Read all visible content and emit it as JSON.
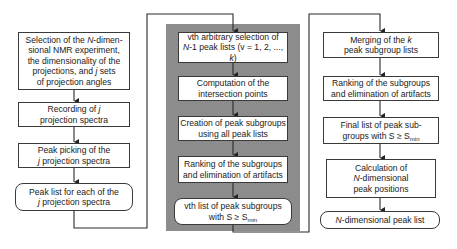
{
  "diagram": {
    "left_column": [
      {
        "id": "L1",
        "shape": "rect",
        "parts": [
          {
            "t": "Selection of the "
          },
          {
            "t": "N",
            "i": true
          },
          {
            "t": "-dimen-\nsional NMR experiment,\nthe dimensionality of the\nprojections, and "
          },
          {
            "t": "j",
            "i": true
          },
          {
            "t": " sets\nof projection angles"
          }
        ]
      },
      {
        "id": "L2",
        "shape": "rect",
        "parts": [
          {
            "t": "Recording of "
          },
          {
            "t": "j",
            "i": true
          },
          {
            "t": "\nprojection spectra"
          }
        ]
      },
      {
        "id": "L3",
        "shape": "rect",
        "parts": [
          {
            "t": "Peak picking of the\n"
          },
          {
            "t": "j",
            "i": true
          },
          {
            "t": " projection spectra"
          }
        ]
      },
      {
        "id": "L4",
        "shape": "rounded",
        "parts": [
          {
            "t": "Peak list for each of the\n"
          },
          {
            "t": "j",
            "i": true
          },
          {
            "t": " projection spectra"
          }
        ]
      }
    ],
    "middle_column": {
      "panel_color": "#8c8c8c",
      "boxes": [
        {
          "id": "M1",
          "shape": "rect",
          "parts": [
            {
              "t": "vth arbitrary selection of\n"
            },
            {
              "t": "N",
              "i": true
            },
            {
              "t": "-1 peak lists (v = 1, 2, ..., "
            },
            {
              "t": "k",
              "i": true
            },
            {
              "t": ")"
            }
          ]
        },
        {
          "id": "M2",
          "shape": "rect",
          "parts": [
            {
              "t": "Computation of the\nintersection points"
            }
          ]
        },
        {
          "id": "M3",
          "shape": "rect",
          "parts": [
            {
              "t": "Creation of peak subgroups\nusing all peak lists"
            }
          ]
        },
        {
          "id": "M4",
          "shape": "rect",
          "parts": [
            {
              "t": "Ranking of the subgroups\nand elimination of artifacts"
            }
          ]
        },
        {
          "id": "M5",
          "shape": "rounded",
          "parts": [
            {
              "t": "vth list of peak subgroups\nwith S ≥ S"
            },
            {
              "t": "min",
              "sub": true
            }
          ]
        }
      ]
    },
    "right_column": [
      {
        "id": "R1",
        "shape": "rect",
        "parts": [
          {
            "t": "Merging of the "
          },
          {
            "t": "k",
            "i": true
          },
          {
            "t": "\npeak subgroup lists"
          }
        ]
      },
      {
        "id": "R2",
        "shape": "rect",
        "parts": [
          {
            "t": "Ranking of the subgroups\nand elimination of artifacts"
          }
        ]
      },
      {
        "id": "R3",
        "shape": "rect",
        "parts": [
          {
            "t": "Final list of peak sub-\ngroups with S ≥ S"
          },
          {
            "t": "min",
            "sub": true
          }
        ]
      },
      {
        "id": "R4",
        "shape": "rect",
        "parts": [
          {
            "t": "Calculation of\n"
          },
          {
            "t": "N",
            "i": true
          },
          {
            "t": "-dimensional\npeak positions"
          }
        ]
      },
      {
        "id": "R5",
        "shape": "rounded",
        "parts": [
          {
            "t": "N",
            "i": true
          },
          {
            "t": "-dimensional peak list"
          }
        ]
      }
    ]
  }
}
